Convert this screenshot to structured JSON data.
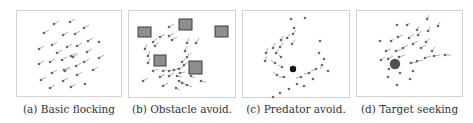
{
  "figure": {
    "panels": [
      {
        "id": "a",
        "caption": "(a) Basic flocking",
        "scenario": "basic-flocking",
        "box": {
          "x": 16,
          "y": 10,
          "w": 106,
          "h": 87
        },
        "boids": [
          [
            37,
            13,
            5,
            -3
          ],
          [
            53,
            11,
            5,
            -3
          ],
          [
            27,
            22,
            5,
            -3
          ],
          [
            46,
            24,
            5,
            -3
          ],
          [
            58,
            23,
            5,
            -3
          ],
          [
            67,
            17,
            5,
            -3
          ],
          [
            71,
            30,
            5,
            -3
          ],
          [
            82,
            31,
            0,
            0
          ],
          [
            22,
            38,
            5,
            -3
          ],
          [
            35,
            34,
            5,
            -3
          ],
          [
            50,
            36,
            5,
            -3
          ],
          [
            60,
            35,
            5,
            -3
          ],
          [
            40,
            42,
            5,
            -3
          ],
          [
            54,
            45,
            5,
            -3
          ],
          [
            70,
            41,
            5,
            -3
          ],
          [
            22,
            53,
            5,
            -3
          ],
          [
            33,
            51,
            5,
            -3
          ],
          [
            45,
            49,
            5,
            -3
          ],
          [
            56,
            46,
            5,
            -3
          ],
          [
            67,
            51,
            5,
            -3
          ],
          [
            82,
            47,
            5,
            -3
          ],
          [
            47,
            59,
            5,
            -3
          ],
          [
            59,
            55,
            5,
            -3
          ],
          [
            35,
            62,
            5,
            -3
          ],
          [
            48,
            60,
            5,
            -3
          ],
          [
            60,
            64,
            5,
            -3
          ],
          [
            76,
            59,
            5,
            -3
          ],
          [
            24,
            69,
            5,
            -3
          ],
          [
            46,
            70,
            5,
            -3
          ],
          [
            33,
            77,
            5,
            -3
          ],
          [
            54,
            76,
            5,
            -3
          ],
          [
            68,
            73,
            0,
            0
          ]
        ],
        "obstacles": [],
        "predator": null,
        "target": null
      },
      {
        "id": "b",
        "caption": "(b) Obstacle avoid.",
        "scenario": "obstacle-avoidance",
        "box": {
          "x": 128,
          "y": 10,
          "w": 108,
          "h": 88
        },
        "boids": [
          [
            40,
            16,
            5,
            -3
          ],
          [
            31,
            26,
            5,
            -3
          ],
          [
            40,
            25,
            5,
            -3
          ],
          [
            43,
            29,
            5,
            -3
          ],
          [
            24,
            31,
            4,
            -4
          ],
          [
            16,
            38,
            2,
            -5
          ],
          [
            26,
            35,
            3,
            -4
          ],
          [
            19,
            45,
            2,
            -5
          ],
          [
            19,
            52,
            2,
            -5
          ],
          [
            58,
            32,
            2,
            -5
          ],
          [
            67,
            32,
            3,
            -5
          ],
          [
            56,
            40,
            2,
            -5
          ],
          [
            53,
            51,
            4,
            -4
          ],
          [
            58,
            46,
            4,
            -4
          ],
          [
            24,
            60,
            5,
            -2
          ],
          [
            34,
            60,
            4,
            -1
          ],
          [
            40,
            60,
            5,
            -1
          ],
          [
            45,
            59,
            5,
            -2
          ],
          [
            50,
            58,
            5,
            -3
          ],
          [
            55,
            54,
            4,
            -3
          ],
          [
            51,
            62,
            5,
            -1
          ],
          [
            31,
            66,
            5,
            -3
          ],
          [
            40,
            65,
            5,
            -3
          ],
          [
            48,
            65,
            5,
            1
          ],
          [
            50,
            70,
            5,
            2
          ],
          [
            53,
            72,
            5,
            2
          ],
          [
            62,
            65,
            4,
            2
          ],
          [
            58,
            74,
            5,
            2
          ],
          [
            14,
            70,
            5,
            -3
          ],
          [
            34,
            75,
            5,
            -3
          ],
          [
            47,
            77,
            4,
            2
          ],
          [
            72,
            70,
            5,
            1
          ]
        ],
        "obstacles": [
          {
            "x": 9,
            "y": 16,
            "w": 13,
            "h": 10
          },
          {
            "x": 50,
            "y": 8,
            "w": 13,
            "h": 11
          },
          {
            "x": 86,
            "y": 15,
            "w": 13,
            "h": 11
          },
          {
            "x": 25,
            "y": 44,
            "w": 12,
            "h": 11
          },
          {
            "x": 60,
            "y": 50,
            "w": 13,
            "h": 13
          }
        ],
        "obstacle_fill": "#8e8e8e",
        "obstacle_stroke": "#3c3c3c",
        "predator": null,
        "target": null
      },
      {
        "id": "c",
        "caption": "(c) Predator avoid.",
        "scenario": "predator-avoidance",
        "box": {
          "x": 242,
          "y": 10,
          "w": 108,
          "h": 88
        },
        "boids": [
          [
            48,
            8,
            0,
            0
          ],
          [
            62,
            7,
            0,
            0
          ],
          [
            51,
            17,
            0,
            0
          ],
          [
            50,
            23,
            3,
            -4
          ],
          [
            44,
            27,
            3,
            -4
          ],
          [
            38,
            29,
            3,
            -4
          ],
          [
            49,
            33,
            3,
            -4
          ],
          [
            37,
            36,
            3,
            -4
          ],
          [
            30,
            37,
            2,
            -5
          ],
          [
            33,
            42,
            3,
            -4
          ],
          [
            23,
            42,
            2,
            -5
          ],
          [
            38,
            46,
            -4,
            -4
          ],
          [
            22,
            50,
            2,
            -5
          ],
          [
            32,
            52,
            -4,
            -3
          ],
          [
            39,
            56,
            -4,
            -2
          ],
          [
            34,
            64,
            -4,
            -3
          ],
          [
            41,
            66,
            -5,
            0
          ],
          [
            77,
            30,
            0,
            0
          ],
          [
            76,
            42,
            0,
            0
          ],
          [
            81,
            48,
            0,
            0
          ],
          [
            79,
            54,
            -2,
            4
          ],
          [
            85,
            60,
            0,
            0
          ],
          [
            73,
            58,
            -5,
            2
          ],
          [
            66,
            62,
            -5,
            1
          ],
          [
            58,
            66,
            -5,
            1
          ],
          [
            70,
            68,
            0,
            0
          ],
          [
            61,
            75,
            0,
            0
          ],
          [
            54,
            73,
            0,
            0
          ],
          [
            46,
            78,
            0,
            0
          ],
          [
            37,
            82,
            0,
            0
          ],
          [
            30,
            86,
            0,
            0
          ]
        ],
        "obstacles": [],
        "predator": {
          "cx": 50,
          "cy": 58,
          "r": 3.2,
          "color": "#111111"
        },
        "target": null
      },
      {
        "id": "d",
        "caption": "(d) Target seeking",
        "scenario": "target-seeking",
        "box": {
          "x": 356,
          "y": 10,
          "w": 107,
          "h": 87
        },
        "boids": [
          [
            40,
            14,
            0,
            0
          ],
          [
            50,
            14,
            3,
            -2
          ],
          [
            70,
            8,
            2,
            -4
          ],
          [
            81,
            15,
            2,
            -4
          ],
          [
            60,
            19,
            2,
            -4
          ],
          [
            71,
            20,
            2,
            -4
          ],
          [
            23,
            30,
            0,
            0
          ],
          [
            34,
            30,
            3,
            -2
          ],
          [
            41,
            26,
            5,
            -2
          ],
          [
            52,
            27,
            5,
            -4
          ],
          [
            61,
            24,
            3,
            -4
          ],
          [
            69,
            31,
            4,
            -4
          ],
          [
            29,
            40,
            5,
            -2
          ],
          [
            39,
            40,
            6,
            -2
          ],
          [
            46,
            37,
            5,
            -3
          ],
          [
            56,
            33,
            5,
            -3
          ],
          [
            64,
            37,
            5,
            -3
          ],
          [
            75,
            40,
            3,
            -4
          ],
          [
            24,
            49,
            4,
            -3
          ],
          [
            31,
            48,
            5,
            -3
          ],
          [
            42,
            46,
            6,
            -2
          ],
          [
            60,
            50,
            6,
            -1
          ],
          [
            68,
            47,
            6,
            -2
          ],
          [
            77,
            45,
            6,
            -1
          ],
          [
            88,
            44,
            6,
            0
          ],
          [
            54,
            52,
            7,
            -1
          ],
          [
            32,
            58,
            0,
            0
          ],
          [
            43,
            62,
            0,
            0
          ],
          [
            56,
            60,
            0,
            0
          ],
          [
            31,
            66,
            0,
            0
          ],
          [
            53,
            68,
            0,
            0
          ],
          [
            40,
            74,
            0,
            0
          ]
        ],
        "obstacles": [],
        "predator": null,
        "target": {
          "cx": 38,
          "cy": 53,
          "r": 5.2,
          "color": "#505050"
        }
      }
    ],
    "colors": {
      "boid": "#6a6a6a",
      "tail": "#8a8a8a",
      "border": "#d2d2d2",
      "caption": "#333333"
    }
  }
}
